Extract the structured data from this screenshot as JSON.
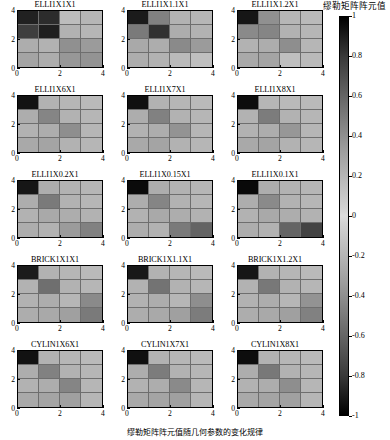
{
  "figure": {
    "caption": "缪勒矩阵阵元值随几何参数的变化规律",
    "colorbar": {
      "title": "缪勒矩阵阵元值",
      "ticks": [
        "1",
        "0.8",
        "0.6",
        "0.4",
        "0.2",
        "0",
        "-0.2",
        "-0.4",
        "-0.6",
        "-0.8",
        "-1"
      ],
      "vmin": -1,
      "vmax": 1,
      "cmap": "gray-diverging"
    },
    "axis": {
      "xticks": [
        "0",
        "2",
        "4"
      ],
      "yticks": [
        "0",
        "2",
        "4"
      ]
    }
  },
  "chart_data": {
    "type": "heatmap",
    "title": "缪勒矩阵阵元值",
    "xlabel": "",
    "ylabel": "",
    "xticks": [
      0,
      2,
      4
    ],
    "yticks": [
      0,
      2,
      4
    ],
    "xlim": [
      0,
      4
    ],
    "ylim": [
      0,
      4
    ],
    "grid": true,
    "legend_position": "right",
    "colorbar": {
      "label": "缪勒矩阵阵元值",
      "ticks": [
        1,
        0.8,
        0.6,
        0.4,
        0.2,
        0,
        -0.2,
        -0.4,
        -0.6,
        -0.8,
        -1
      ],
      "vmin": -1,
      "vmax": 1
    },
    "grid_layout": {
      "rows": 5,
      "cols": 3
    },
    "panels": [
      {
        "title": "ELLI1X1X1",
        "matrix": [
          [
            -0.85,
            -0.8,
            0.15,
            0.18
          ],
          [
            -0.72,
            -0.86,
            0.2,
            0.18
          ],
          [
            0.22,
            0.2,
            -0.35,
            -0.3
          ],
          [
            0.26,
            0.22,
            -0.32,
            -0.34
          ]
        ]
      },
      {
        "title": "ELLI1X1.1X1",
        "matrix": [
          [
            -0.88,
            -0.42,
            0.2,
            0.18
          ],
          [
            -0.45,
            -0.78,
            0.22,
            0.2
          ],
          [
            0.24,
            0.22,
            -0.38,
            0.3
          ],
          [
            0.22,
            0.2,
            0.16,
            0.14
          ]
        ]
      },
      {
        "title": "ELLI1X1.2X1",
        "matrix": [
          [
            -0.9,
            -0.35,
            0.18,
            0.16
          ],
          [
            -0.38,
            -0.4,
            0.2,
            0.18
          ],
          [
            0.2,
            0.22,
            -0.36,
            0.18
          ],
          [
            0.24,
            0.26,
            0.14,
            0.16
          ]
        ]
      },
      {
        "title": "ELLI1X6X1",
        "matrix": [
          [
            -0.92,
            0.2,
            0.18,
            0.16
          ],
          [
            0.22,
            -0.4,
            0.2,
            0.18
          ],
          [
            0.2,
            0.22,
            -0.36,
            0.18
          ],
          [
            0.24,
            0.26,
            0.2,
            0.18
          ]
        ]
      },
      {
        "title": "ELLI1X7X1",
        "matrix": [
          [
            -0.93,
            0.2,
            0.18,
            0.16
          ],
          [
            0.22,
            -0.42,
            0.2,
            0.18
          ],
          [
            0.2,
            0.22,
            -0.34,
            0.18
          ],
          [
            0.24,
            0.26,
            0.2,
            0.18
          ]
        ]
      },
      {
        "title": "ELLI1X8X1",
        "matrix": [
          [
            -0.94,
            0.18,
            0.16,
            0.16
          ],
          [
            0.2,
            -0.44,
            0.2,
            0.18
          ],
          [
            0.2,
            0.22,
            -0.32,
            0.18
          ],
          [
            0.24,
            0.26,
            0.2,
            0.18
          ]
        ]
      },
      {
        "title": "ELLI1X0.2X1",
        "matrix": [
          [
            -0.9,
            0.22,
            0.2,
            0.18
          ],
          [
            0.22,
            -0.45,
            0.2,
            0.18
          ],
          [
            0.2,
            0.24,
            0.22,
            0.2
          ],
          [
            0.22,
            0.2,
            -0.3,
            -0.42
          ]
        ]
      },
      {
        "title": "ELLI1X0.15X1",
        "matrix": [
          [
            -0.95,
            0.22,
            0.2,
            0.18
          ],
          [
            0.22,
            -0.4,
            0.2,
            0.18
          ],
          [
            0.2,
            0.24,
            0.22,
            0.2
          ],
          [
            0.22,
            0.2,
            -0.45,
            -0.55
          ]
        ]
      },
      {
        "title": "ELLI1X0.1X1",
        "matrix": [
          [
            -0.96,
            0.22,
            0.2,
            0.18
          ],
          [
            0.22,
            -0.38,
            0.2,
            0.18
          ],
          [
            0.2,
            0.24,
            0.22,
            0.2
          ],
          [
            0.22,
            0.2,
            -0.55,
            -0.7
          ]
        ]
      },
      {
        "title": "BRICK1X1X1",
        "matrix": [
          [
            -0.88,
            0.2,
            0.18,
            0.16
          ],
          [
            0.2,
            -0.5,
            0.2,
            0.18
          ],
          [
            0.2,
            0.22,
            0.18,
            -0.38
          ],
          [
            0.22,
            0.24,
            0.28,
            -0.45
          ]
        ]
      },
      {
        "title": "BRICK1X1.1X1",
        "matrix": [
          [
            -0.89,
            0.2,
            0.18,
            0.16
          ],
          [
            0.2,
            -0.48,
            0.2,
            0.18
          ],
          [
            0.2,
            0.22,
            0.18,
            -0.36
          ],
          [
            0.22,
            0.24,
            0.28,
            -0.44
          ]
        ]
      },
      {
        "title": "BRICK1X1.2X1",
        "matrix": [
          [
            -0.9,
            0.2,
            0.18,
            0.16
          ],
          [
            0.2,
            -0.46,
            0.2,
            0.18
          ],
          [
            0.2,
            0.22,
            0.18,
            -0.34
          ],
          [
            0.22,
            0.24,
            0.28,
            -0.42
          ]
        ]
      },
      {
        "title": "CYLIN1X6X1",
        "matrix": [
          [
            -0.92,
            0.2,
            0.18,
            0.16
          ],
          [
            0.22,
            -0.42,
            0.2,
            0.18
          ],
          [
            0.2,
            0.22,
            -0.4,
            0.18
          ],
          [
            0.24,
            0.26,
            0.28,
            0.18
          ]
        ]
      },
      {
        "title": "CYLIN1X7X1",
        "matrix": [
          [
            -0.93,
            0.2,
            0.18,
            0.16
          ],
          [
            0.22,
            -0.44,
            0.2,
            0.18
          ],
          [
            0.2,
            0.22,
            -0.38,
            0.18
          ],
          [
            0.24,
            0.26,
            0.28,
            0.18
          ]
        ]
      },
      {
        "title": "CYLIN1X8X1",
        "matrix": [
          [
            -0.94,
            0.2,
            0.18,
            0.16
          ],
          [
            0.22,
            -0.46,
            0.2,
            0.18
          ],
          [
            0.2,
            0.22,
            -0.36,
            0.18
          ],
          [
            0.24,
            0.26,
            0.28,
            0.18
          ]
        ]
      }
    ]
  }
}
